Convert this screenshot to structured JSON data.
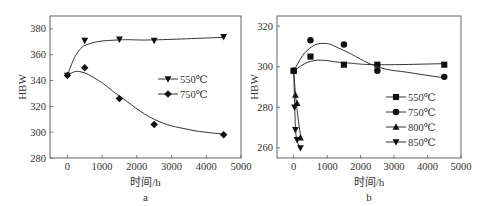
{
  "chart_data": [
    {
      "panel": "a",
      "type": "scatter",
      "title": "",
      "caption": "a",
      "xlabel": "时间/h",
      "ylabel": "HBW",
      "xlim": [
        -500,
        5000
      ],
      "ylim": [
        280,
        390
      ],
      "xticks": [
        0,
        1000,
        2000,
        3000,
        4000,
        5000
      ],
      "xtick_labels": [
        "0",
        "1000",
        "2000",
        "3000",
        "4000",
        "5000"
      ],
      "yticks": [
        280,
        300,
        320,
        340,
        360,
        380
      ],
      "ytick_labels": [
        "280",
        "300",
        "320",
        "340",
        "360",
        "380"
      ],
      "grid": false,
      "legend_position": "right-middle",
      "series": [
        {
          "name": "550℃",
          "marker": "triangle-down",
          "x": [
            0,
            500,
            1500,
            2500,
            4500
          ],
          "y": [
            344,
            371,
            372,
            371,
            374
          ]
        },
        {
          "name": "750℃",
          "marker": "diamond",
          "x": [
            0,
            500,
            1500,
            2500,
            4500
          ],
          "y": [
            344,
            350,
            326,
            306,
            298
          ]
        }
      ]
    },
    {
      "panel": "b",
      "type": "scatter",
      "title": "",
      "caption": "b",
      "xlabel": "时间/h",
      "ylabel": "HBW",
      "xlim": [
        -500,
        5000
      ],
      "ylim": [
        255,
        325
      ],
      "xticks": [
        0,
        1000,
        2000,
        3000,
        4000,
        5000
      ],
      "xtick_labels": [
        "0",
        "1000",
        "2000",
        "3000",
        "4000",
        "5000"
      ],
      "yticks": [
        260,
        280,
        300,
        320
      ],
      "ytick_labels": [
        "260",
        "280",
        "300",
        "320"
      ],
      "grid": false,
      "legend_position": "right-lower",
      "series": [
        {
          "name": "550℃",
          "marker": "square",
          "x": [
            0,
            500,
            1500,
            2500,
            4500
          ],
          "y": [
            298,
            305,
            301,
            301,
            301
          ]
        },
        {
          "name": "750℃",
          "marker": "circle",
          "x": [
            0,
            500,
            1500,
            2500,
            4500
          ],
          "y": [
            298,
            313,
            311,
            298,
            295
          ]
        },
        {
          "name": "800℃",
          "marker": "triangle-up",
          "x": [
            0,
            50,
            100,
            200
          ],
          "y": [
            298,
            286,
            282,
            265
          ]
        },
        {
          "name": "850℃",
          "marker": "triangle-down",
          "x": [
            0,
            25,
            50,
            100,
            200
          ],
          "y": [
            298,
            280,
            269,
            264,
            260
          ]
        }
      ]
    }
  ]
}
